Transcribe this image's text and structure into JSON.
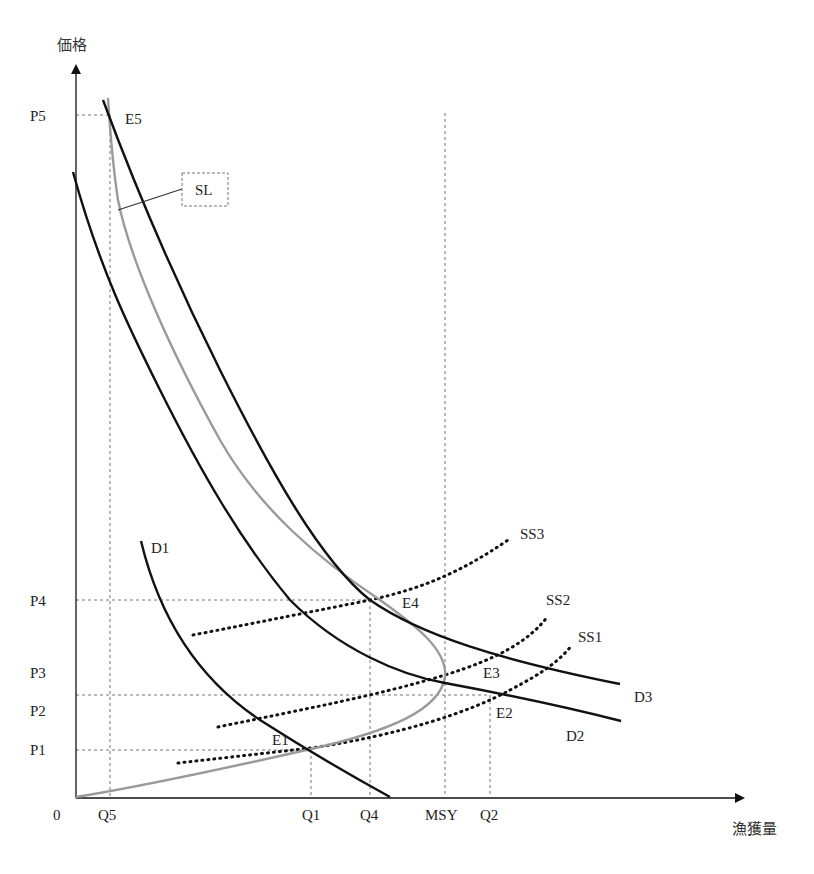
{
  "axes": {
    "y_label": "価格",
    "x_label": "漁獲量",
    "origin_label": "0"
  },
  "price_levels": [
    {
      "label": "P5",
      "y": 115
    },
    {
      "label": "P4",
      "y": 600
    },
    {
      "label": "P3",
      "y": 672
    },
    {
      "label": "P2",
      "y": 711
    },
    {
      "label": "P1",
      "y": 754
    }
  ],
  "quantity_levels": [
    {
      "label": "Q5",
      "x": 110
    },
    {
      "label": "Q1",
      "x": 311
    },
    {
      "label": "Q4",
      "x": 370
    },
    {
      "label": "MSY",
      "x": 445
    },
    {
      "label": "Q2",
      "x": 490
    }
  ],
  "curve_labels": {
    "D1": "D1",
    "D2": "D2",
    "D3": "D3",
    "SS1": "SS1",
    "SS2": "SS2",
    "SS3": "SS3",
    "SL": "SL"
  },
  "equilibrium_labels": {
    "E1": "E1",
    "E2": "E2",
    "E3": "E3",
    "E4": "E4",
    "E5": "E5"
  },
  "colors": {
    "demand": "#111111",
    "supply_long_run": "#9a9a9a",
    "supply_short_run": "#111111",
    "guide": "#777777"
  }
}
